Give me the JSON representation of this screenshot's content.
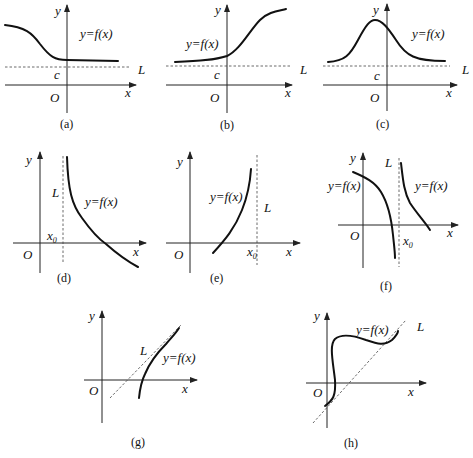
{
  "figure": {
    "panels": [
      {
        "id": "a",
        "caption": "(a)",
        "func_label": "y=f(x)",
        "asymptote_label": "L",
        "const_label": "c",
        "origin_label": "O",
        "x_label": "x",
        "y_label": "y",
        "asymptote_type": "horizontal"
      },
      {
        "id": "b",
        "caption": "(b)",
        "func_label": "y=f(x)",
        "asymptote_label": "L",
        "const_label": "c",
        "origin_label": "O",
        "x_label": "x",
        "y_label": "y",
        "asymptote_type": "horizontal"
      },
      {
        "id": "c",
        "caption": "(c)",
        "func_label": "y=f(x)",
        "asymptote_label": "L",
        "const_label": "c",
        "origin_label": "O",
        "x_label": "x",
        "y_label": "y",
        "asymptote_type": "horizontal"
      },
      {
        "id": "d",
        "caption": "(d)",
        "func_label": "y=f(x)",
        "asymptote_label": "L",
        "const_label": "x",
        "const_sub": "0",
        "origin_label": "O",
        "x_label": "x",
        "y_label": "y",
        "asymptote_type": "vertical"
      },
      {
        "id": "e",
        "caption": "(e)",
        "func_label": "y=f(x)",
        "asymptote_label": "L",
        "const_label": "x",
        "const_sub": "0",
        "origin_label": "O",
        "x_label": "x",
        "y_label": "y",
        "asymptote_type": "vertical"
      },
      {
        "id": "f",
        "caption": "(f)",
        "func_label": "y=f(x)",
        "func_label_2": "y=f(x)",
        "asymptote_label": "L",
        "const_label": "x",
        "const_sub": "0",
        "origin_label": "O",
        "x_label": "x",
        "y_label": "y",
        "asymptote_type": "vertical"
      },
      {
        "id": "g",
        "caption": "(g)",
        "func_label": "y=f(x)",
        "asymptote_label": "L",
        "origin_label": "O",
        "x_label": "x",
        "y_label": "y",
        "asymptote_type": "oblique"
      },
      {
        "id": "h",
        "caption": "(h)",
        "func_label": "y=f(x)",
        "asymptote_label": "L",
        "origin_label": "O",
        "x_label": "x",
        "y_label": "y",
        "asymptote_type": "oblique"
      }
    ]
  }
}
